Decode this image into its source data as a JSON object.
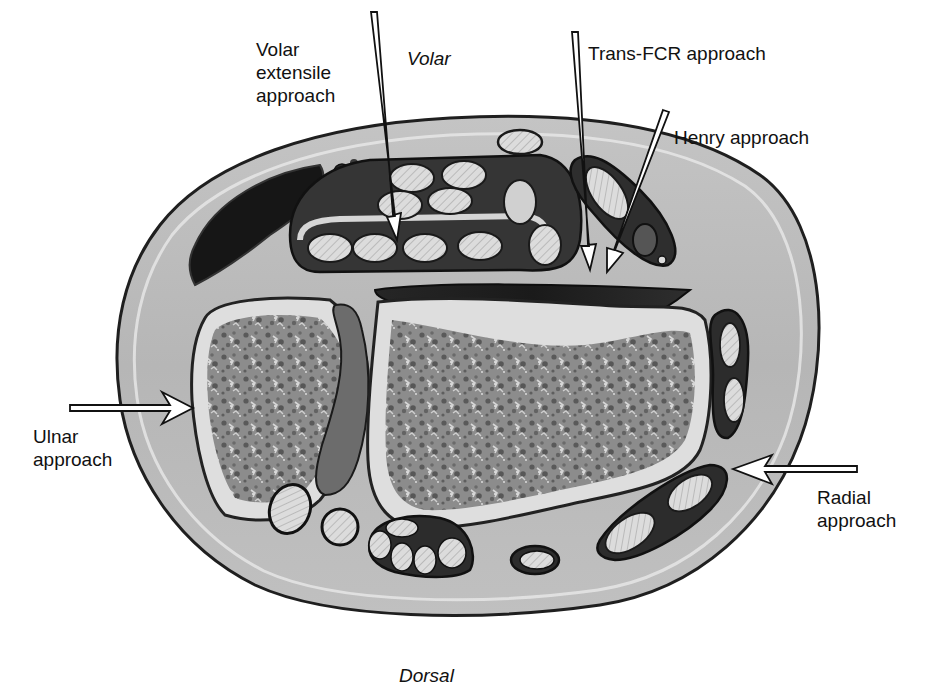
{
  "figure": {
    "type": "anatomical cross-section",
    "palette": {
      "background": "#ffffff",
      "skin_outline": "#2a2a2a",
      "soft_tissue": "#b9b9b9",
      "fascia_light": "#e2e2e2",
      "tendon_sheath_dark": "#3a3a3a",
      "tendon": "#d8d8d8",
      "muscle_dark": "#1e1e1e",
      "cancellous_bone": "#8a8a8a",
      "cortical_bone": "#dedede",
      "interosseous": "#6e6e6e",
      "arrow_fill": "#ffffff",
      "arrow_stroke": "#111111"
    }
  },
  "orientation": {
    "top": "Volar",
    "bottom": "Dorsal"
  },
  "approaches": [
    {
      "id": "volar-extensile",
      "label": "Volar\nextensile\napproach",
      "direction": "down"
    },
    {
      "id": "trans-fcr",
      "label": "Trans-FCR approach",
      "direction": "down"
    },
    {
      "id": "henry",
      "label": "Henry approach",
      "direction": "down-left"
    },
    {
      "id": "ulnar",
      "label": "Ulnar\napproach",
      "direction": "right"
    },
    {
      "id": "radial",
      "label": "Radial\napproach",
      "direction": "left"
    }
  ]
}
